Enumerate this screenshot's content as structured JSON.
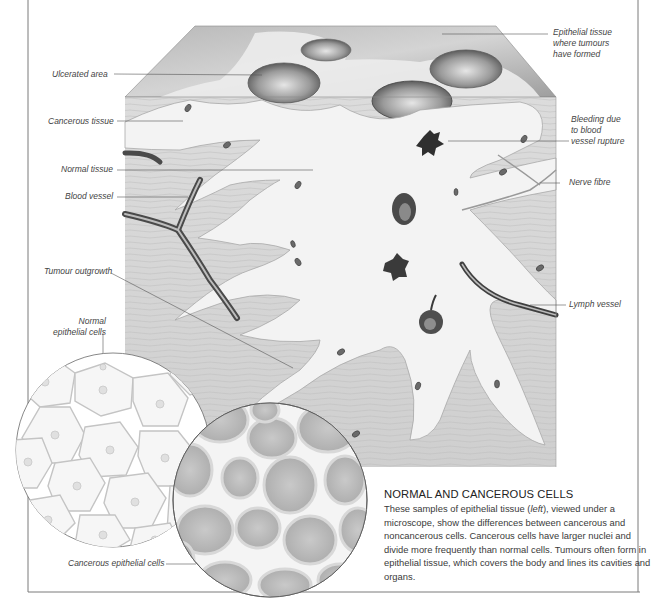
{
  "figure": {
    "colors": {
      "frame": "#7a7a7a",
      "leader_line": "#555555",
      "label_text": "#444444",
      "tissue_normal": "#d6d6d6",
      "tissue_cancerous": "#f2f2f2",
      "vessel_dark": "#4a4a4a",
      "cell_normal_fill": "#f4f4f4",
      "cell_cancer_fill": "#bdbdbd"
    }
  },
  "labels": {
    "epithelial_tissue": "Epithelial tissue\nwhere tumours\nhave formed",
    "ulcerated_area": "Ulcerated area",
    "cancerous_tissue": "Cancerous tissue",
    "bleeding": "Bleeding due\nto blood\nvessel rupture",
    "normal_tissue": "Normal tissue",
    "nerve_fibre": "Nerve fibre",
    "blood_vessel": "Blood vessel",
    "tumour_outgrowth": "Tumour outgrowth",
    "lymph_vessel": "Lymph vessel",
    "normal_epithelial_cells": "Normal\nepithelial cells",
    "cancerous_epithelial_cells": "Cancerous epithelial cells"
  },
  "caption": {
    "title": "NORMAL AND CANCEROUS CELLS",
    "body_before": "These samples of epithelial tissue (",
    "body_emphasis": "left",
    "body_after": "), viewed under a microscope, show the differences between cancerous and noncancerous cells. Cancerous cells have larger nuclei and divide more frequently than normal cells. Tumours often form in epithelial tissue, which covers the body and lines its cavities and organs."
  }
}
